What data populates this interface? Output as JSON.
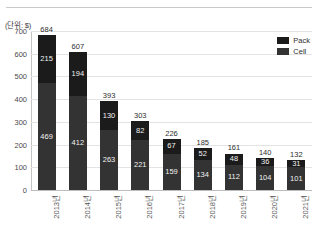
{
  "chart_data": {
    "type": "bar",
    "title": "",
    "subtitle": "",
    "unit_caption": "(단위: $)",
    "xlabel": "",
    "ylabel": "",
    "ylim": [
      0,
      700
    ],
    "ytick_values": [
      0,
      100,
      200,
      300,
      400,
      500,
      600,
      700
    ],
    "ytick_labels": [
      "0",
      "100",
      "200",
      "300",
      "400",
      "500",
      "600",
      "700"
    ],
    "grid": true,
    "stacked": true,
    "legend_position": "top-right",
    "categories": [
      "2013년",
      "2014년",
      "2015년",
      "2016년",
      "2017년",
      "2018년",
      "2019년",
      "2020년",
      "2021년"
    ],
    "series": [
      {
        "name": "Pack",
        "color": "#1b1b1b",
        "values": [
          215,
          194,
          130,
          82,
          67,
          52,
          48,
          36,
          31
        ]
      },
      {
        "name": "Cell",
        "color": "#333333",
        "values": [
          469,
          412,
          263,
          221,
          159,
          134,
          112,
          104,
          101
        ]
      }
    ],
    "totals": [
      684,
      607,
      393,
      303,
      226,
      185,
      161,
      140,
      132
    ],
    "total_labels": [
      "684",
      "607",
      "393",
      "303",
      "226",
      "185",
      "161",
      "140",
      "132"
    ],
    "segment_labels": {
      "Pack": [
        "215",
        "194",
        "130",
        "82",
        "67",
        "52",
        "48",
        "36",
        "31"
      ],
      "Cell": [
        "469",
        "412",
        "263",
        "221",
        "159",
        "134",
        "112",
        "104",
        "101"
      ]
    }
  },
  "legend": {
    "items": [
      {
        "label": "Pack",
        "color": "#1b1b1b"
      },
      {
        "label": "Cell",
        "color": "#333333"
      }
    ]
  }
}
